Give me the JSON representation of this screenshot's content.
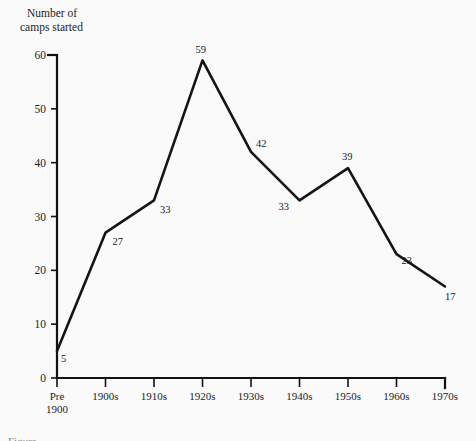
{
  "figure": {
    "background_color": "#fafafa",
    "ink_color": "#141414",
    "caption_partial": "Figure"
  },
  "chart_data": {
    "type": "line",
    "title": "",
    "ylabel_line1": "Number of",
    "ylabel_line2": "camps started",
    "xlabel": "",
    "categories": [
      "Pre\n1900",
      "1900s",
      "1910s",
      "1920s",
      "1930s",
      "1940s",
      "1950s",
      "1960s",
      "1970s"
    ],
    "category_labels": [
      {
        "line1": "Pre",
        "line2": "1900"
      },
      {
        "line1": "1900s",
        "line2": ""
      },
      {
        "line1": "1910s",
        "line2": ""
      },
      {
        "line1": "1920s",
        "line2": ""
      },
      {
        "line1": "1930s",
        "line2": ""
      },
      {
        "line1": "1940s",
        "line2": ""
      },
      {
        "line1": "1950s",
        "line2": ""
      },
      {
        "line1": "1960s",
        "line2": ""
      },
      {
        "line1": "1970s",
        "line2": ""
      }
    ],
    "values": [
      5,
      27,
      33,
      59,
      42,
      33,
      39,
      23,
      17
    ],
    "point_labels": [
      "5",
      "27",
      "33",
      "59",
      "42",
      "33",
      "39",
      "23",
      "17"
    ],
    "ylim": [
      0,
      60
    ],
    "xlim_ticks": 9,
    "yticks": [
      0,
      10,
      20,
      30,
      40,
      50,
      60
    ],
    "ytick_labels": [
      "0",
      "10",
      "20",
      "30",
      "40",
      "50",
      "60"
    ],
    "grid": false,
    "legend": null,
    "series": [
      {
        "name": "Number of camps started",
        "values": [
          5,
          27,
          33,
          59,
          42,
          33,
          39,
          23,
          17
        ]
      }
    ]
  },
  "geometry": {
    "origin_x": 57,
    "origin_y": 378,
    "top_y": 55,
    "right_x": 445,
    "x_step": 48.5,
    "y_per_unit": 5.3833
  },
  "label_offsets": [
    {
      "dx": 4,
      "dy": 11
    },
    {
      "dx": 7,
      "dy": 12
    },
    {
      "dx": 6,
      "dy": 13
    },
    {
      "dx": -7,
      "dy": -7
    },
    {
      "dx": 5,
      "dy": -5
    },
    {
      "dx": -21,
      "dy": 10
    },
    {
      "dx": -6,
      "dy": -8
    },
    {
      "dx": 5,
      "dy": 10
    },
    {
      "dx": 0,
      "dy": 14
    }
  ]
}
